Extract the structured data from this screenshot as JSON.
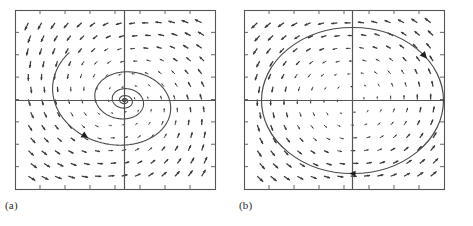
{
  "figure": {
    "type": "phase-portrait-pair",
    "background": "#ffffff",
    "stroke_color": "#555555",
    "field_color": "#3a3a3a",
    "width": 473,
    "height": 226
  },
  "panels": [
    {
      "id": "a",
      "caption": "(a)",
      "kind": "stable-spiral",
      "frame": {
        "x": 15,
        "y": 10,
        "width": 200,
        "height": 179
      },
      "axes": {
        "x_axis_y": 100,
        "y_axis_x": 124,
        "ticks_per_side": 8
      },
      "trajectory": {
        "shape": "logarithmic-spiral",
        "turns": 5,
        "direction": "counterclockwise-inward",
        "start_radius_x": 80,
        "start_radius_y": 62,
        "decay": 0.62,
        "tilt_deg": -8,
        "arrow_at_angle_deg": 38
      },
      "vector_field": {
        "style": "small-arrows",
        "grid_cols": 14,
        "grid_rows": 13,
        "kind": "spiral-sink"
      }
    },
    {
      "id": "b",
      "caption": "(b)",
      "kind": "center-closed-orbit",
      "frame": {
        "x": 8,
        "y": 10,
        "width": 200,
        "height": 179
      },
      "axes": {
        "x_axis_y": 100,
        "y_axis_x": 116,
        "ticks_per_side": 8
      },
      "trajectory": {
        "shape": "ellipse",
        "turns": 1,
        "direction": "clockwise",
        "radius_x": 91,
        "radius_y": 73,
        "tilt_deg": 0,
        "arrow_at_angle_deg": 35,
        "arrow_second_at_angle_deg": 268
      },
      "vector_field": {
        "style": "small-arrows",
        "grid_cols": 14,
        "grid_rows": 13,
        "kind": "center"
      }
    }
  ],
  "chart_data": {
    "type": "scatter",
    "title": "",
    "xlabel": "",
    "ylabel": "",
    "grid": false,
    "legend": "none",
    "subplots": [
      {
        "label": "(a)",
        "description": "Direction field of a linear system with a stable spiral (spiral sink); one trajectory spirals counterclockwise inward to the origin.",
        "xlim": [
          -2,
          2
        ],
        "ylim": [
          -2,
          2
        ],
        "series": [
          {
            "name": "spiral trajectory",
            "parametric": "r(t) = r0 * exp(-k t), theta(t) = t",
            "r0": 1.6,
            "k": 0.095,
            "theta_range_deg": [
              30,
              1830
            ],
            "aspect_x": 1.0,
            "aspect_y": 0.78
          }
        ]
      },
      {
        "label": "(b)",
        "description": "Direction field of a linear system with a center; the trajectory is a closed elliptical orbit traversed clockwise.",
        "xlim": [
          -2,
          2
        ],
        "ylim": [
          -2,
          2
        ],
        "series": [
          {
            "name": "closed orbit",
            "parametric": "x = a cos t, y = b sin t",
            "a": 1.82,
            "b": 1.63
          }
        ]
      }
    ]
  }
}
